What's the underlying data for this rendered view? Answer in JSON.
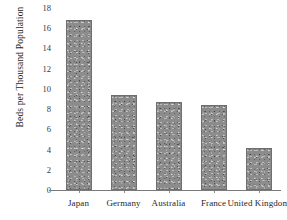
{
  "chart_data": {
    "type": "bar",
    "title": "",
    "xlabel": "",
    "ylabel": "Beds per Thousand Population",
    "categories": [
      "Japan",
      "Germany",
      "Australia",
      "France",
      "United Kingdom"
    ],
    "values": [
      16.8,
      9.4,
      8.7,
      8.4,
      4.2
    ],
    "ylim": [
      0,
      18
    ],
    "ytick_labels": [
      "0",
      "2",
      "4",
      "6",
      "8",
      "10",
      "12",
      "14",
      "16",
      "18"
    ],
    "ytick_values": [
      0,
      2,
      4,
      6,
      8,
      10,
      12,
      14,
      16,
      18
    ],
    "grid": false,
    "legend": "none",
    "bar_color": "#8c8c8c",
    "axis_color": "#7a7a7a",
    "background_color": "#ffffff"
  }
}
